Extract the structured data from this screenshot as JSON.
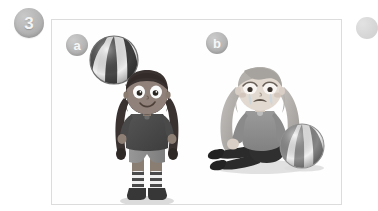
{
  "exercise": {
    "number": "3",
    "badge_color": "#b4b4b4",
    "badge_text_color": "#f4f4f4"
  },
  "panel": {
    "border_color": "#dcdcdc",
    "background_color": "#fefefe"
  },
  "sub_panels": [
    {
      "label": "a",
      "badge_color": "#b5b5b5",
      "scene_description": "girl bouncing beach ball on her head",
      "figure": {
        "name": "happy-girl",
        "expression": "smiling",
        "hair": "dark braided pigtails",
        "skin_tone": "#8f8076",
        "top_color": "#4a4a4a",
        "shorts_color": "#8b8b8b",
        "socks": "striped",
        "shoes_color": "#3a3a3a"
      },
      "ball": {
        "name": "beach-ball-airborne",
        "state": "in the air above head",
        "stripe_dark": "#4d4d4d",
        "stripe_light": "#efefef",
        "motion_lines": 3
      }
    },
    {
      "label": "b",
      "badge_color": "#b5b5b5",
      "scene_description": "girl sitting on the ground crying, ball on the ground",
      "figure": {
        "name": "sad-girl",
        "expression": "crying",
        "hair": "long wavy light hair",
        "skin_tone": "#d9cfc6",
        "top_color": "#8d8d8d",
        "pants_color": "#2b2b2b",
        "shoes_color": "#232323",
        "tears": 2
      },
      "ball": {
        "name": "beach-ball-ground",
        "state": "resting on the ground",
        "stripe_dark": "#7a7a7a",
        "stripe_light": "#f1f1f1"
      }
    }
  ],
  "next_item_badge": {
    "visible_partial": true,
    "color": "#c4c4c4"
  }
}
